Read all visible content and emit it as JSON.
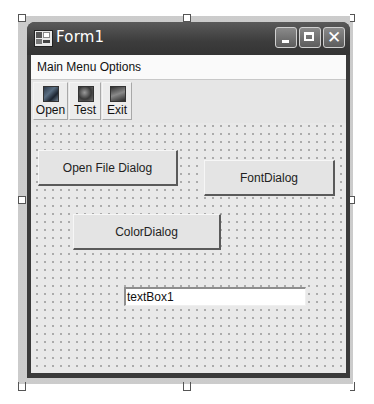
{
  "window": {
    "title": "Form1",
    "icon": "form-icon",
    "caption_buttons": [
      {
        "name": "minimize",
        "icon": "minimize-icon",
        "glyph": ""
      },
      {
        "name": "maximize",
        "icon": "maximize-icon",
        "glyph": ""
      },
      {
        "name": "close",
        "icon": "close-icon",
        "glyph": "✕"
      }
    ]
  },
  "menu": {
    "items": [
      {
        "label": "Main Menu Options"
      }
    ]
  },
  "toolbar": {
    "buttons": [
      {
        "label": "Open",
        "icon": "open-icon"
      },
      {
        "label": "Test",
        "icon": "test-icon"
      },
      {
        "label": "Exit",
        "icon": "exit-icon"
      }
    ]
  },
  "form": {
    "buttons": {
      "open_file_dialog": "Open File Dialog",
      "font_dialog": "FontDialog",
      "color_dialog": "ColorDialog"
    },
    "textbox": {
      "value": "textBox1"
    }
  },
  "colors": {
    "title_bar": "#3c3c3c",
    "client_background": "#e9e9e9",
    "menu_background": "#fafafa"
  }
}
